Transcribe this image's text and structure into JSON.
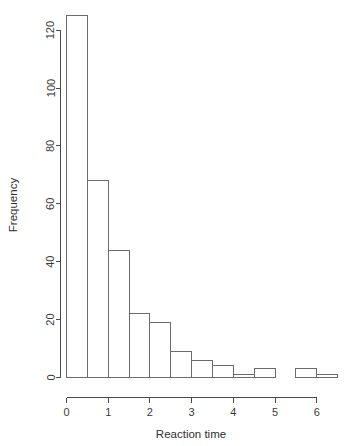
{
  "chart_data": {
    "type": "bar",
    "title": "",
    "subtitle": "",
    "xlabel": "Reaction time",
    "ylabel": "Frequency",
    "xlim": [
      0,
      6.5
    ],
    "ylim": [
      0,
      125
    ],
    "grid": false,
    "legend": null,
    "bin_width": 0.5,
    "bin_edges": [
      0,
      0.5,
      1,
      1.5,
      2,
      2.5,
      3,
      3.5,
      4,
      4.5,
      5,
      5.5,
      6,
      6.5
    ],
    "categories": [
      "0-0.5",
      "0.5-1",
      "1-1.5",
      "1.5-2",
      "2-2.5",
      "2.5-3",
      "3-3.5",
      "3.5-4",
      "4-4.5",
      "4.5-5",
      "5-5.5",
      "5.5-6",
      "6-6.5"
    ],
    "values": [
      125,
      68,
      44,
      22,
      19,
      9,
      6,
      4,
      1,
      3,
      0,
      3,
      1
    ],
    "x_ticks": [
      0,
      1,
      2,
      3,
      4,
      5,
      6
    ],
    "x_tick_labels": [
      "0",
      "1",
      "2",
      "3",
      "4",
      "5",
      "6"
    ],
    "y_ticks": [
      0,
      20,
      40,
      60,
      80,
      100,
      120
    ],
    "y_tick_labels": [
      "0",
      "20",
      "40",
      "60",
      "80",
      "100",
      "120"
    ],
    "colors": {
      "bar_fill": "#ffffff",
      "bar_stroke": "#6b6b6b",
      "axis": "#4a4a4a",
      "text": "#3a3a3a",
      "background": "#ffffff"
    }
  }
}
